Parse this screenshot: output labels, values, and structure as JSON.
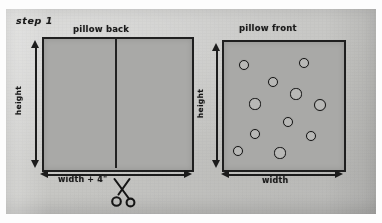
{
  "document": {
    "step_label": "step 1",
    "background_color": "#c7c7c5",
    "ink_color": "#1b1b1b",
    "fabric_color": "#a9a9a7"
  },
  "diagrams": [
    {
      "id": "pillow-back",
      "title": "pillow back",
      "height_label": "height",
      "width_label": "width + 4\"",
      "panels": 2,
      "has_center_seam": true,
      "dots": []
    },
    {
      "id": "pillow-front",
      "title": "pillow front",
      "height_label": "height",
      "width_label": "width",
      "panels": 1,
      "has_center_seam": false,
      "dots": [
        {
          "x": 19,
          "y": 22,
          "r": 4.0
        },
        {
          "x": 79,
          "y": 20,
          "r": 4.4
        },
        {
          "x": 48,
          "y": 39,
          "r": 4.4
        },
        {
          "x": 71,
          "y": 51,
          "r": 4.6
        },
        {
          "x": 30,
          "y": 61,
          "r": 4.6
        },
        {
          "x": 95,
          "y": 62,
          "r": 5.0
        },
        {
          "x": 63,
          "y": 79,
          "r": 4.2
        },
        {
          "x": 30,
          "y": 91,
          "r": 4.2
        },
        {
          "x": 86,
          "y": 93,
          "r": 4.2
        },
        {
          "x": 13,
          "y": 108,
          "r": 4.2
        },
        {
          "x": 55,
          "y": 110,
          "r": 4.6
        }
      ]
    }
  ],
  "icons": {
    "scissors": "scissors-icon",
    "arrow_vertical": "double-arrow-vertical-icon",
    "arrow_horizontal": "double-arrow-horizontal-icon"
  }
}
